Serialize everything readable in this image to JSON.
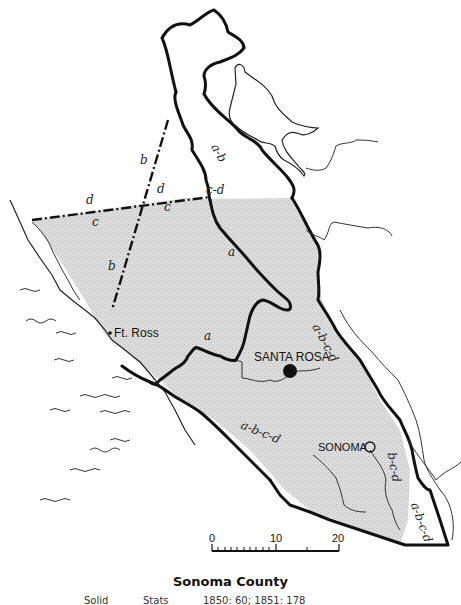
{
  "title": "Sonoma County",
  "caption": {
    "col1": "Solid",
    "col2": "Stats",
    "col3": "1850: 60; 1851: 178"
  },
  "places": {
    "santa_rosa": "SANTA ROSA",
    "sonoma": "SONOMA",
    "ft_ross": "Ft. Ross"
  },
  "boundary_labels": {
    "a_b_north": "a-b",
    "c_d_top": "c-d",
    "d_left": "d",
    "c_left": "c",
    "d_mid": "d",
    "c_mid": "c",
    "b_upper": "b",
    "b_lower": "b",
    "a_inner": "a",
    "a_west": "a",
    "abcd_east": "a-b-c-d",
    "abcd_south": "a-b-c-d",
    "bcd_southeast": "b-c-d",
    "abcd_corner": "a-b-c-d"
  },
  "scale_bar": {
    "ticks": [
      "0",
      "10",
      "20"
    ],
    "unit": "miles"
  },
  "colors": {
    "county_fill": "#d9d9d9",
    "line": "#111111",
    "background": "#ffffff"
  }
}
